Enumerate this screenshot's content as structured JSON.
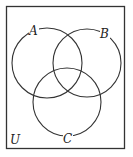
{
  "diagram": {
    "type": "venn",
    "universe_label": "U",
    "sets": [
      {
        "label": "A",
        "cx": 47,
        "cy": 63,
        "r": 35,
        "label_x": 33,
        "label_y": 34
      },
      {
        "label": "B",
        "cx": 87,
        "cy": 63,
        "r": 34,
        "label_x": 104,
        "label_y": 38
      },
      {
        "label": "C",
        "cx": 67,
        "cy": 102,
        "r": 34,
        "label_x": 68,
        "label_y": 144
      }
    ],
    "universe_box": {
      "x": 6,
      "y": 6,
      "width": 119,
      "height": 143
    },
    "stroke_color": "#333333"
  }
}
